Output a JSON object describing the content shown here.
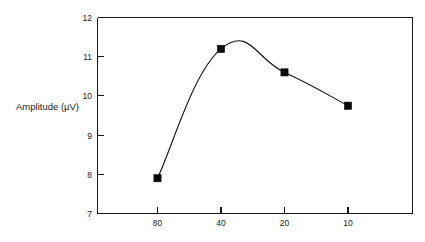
{
  "figure": {
    "background_color": "#ffffff",
    "width": 425,
    "height": 242
  },
  "chart_data": {
    "type": "line",
    "title": "",
    "subtitle": "",
    "xlabel": "",
    "ylabel": "Amplitude (µV)",
    "categories": [
      "80",
      "40",
      "20",
      "10"
    ],
    "values": [
      7.9,
      11.2,
      10.6,
      9.75
    ],
    "series": [
      {
        "name": "Amplitude",
        "values": [
          7.9,
          11.2,
          10.6,
          9.75
        ]
      }
    ],
    "x_tick_labels": [
      "80",
      "40",
      "20",
      "10"
    ],
    "y_tick_labels": [
      "7",
      "8",
      "9",
      "10",
      "11",
      "12"
    ],
    "y_tick_values": [
      7,
      8,
      9,
      10,
      11,
      12
    ],
    "ylim": [
      7,
      12
    ],
    "grid": false,
    "legend": false,
    "legend_position": "none",
    "marker": "square",
    "marker_color": "#0b0b0b",
    "line_color": "#111111",
    "smoothing": "spline",
    "annotations": []
  },
  "axes": {
    "y_label": "Amplitude (µV)",
    "y_ticks": [
      {
        "label": "12",
        "value": 12
      },
      {
        "label": "11",
        "value": 11
      },
      {
        "label": "10",
        "value": 10
      },
      {
        "label": "9",
        "value": 9
      },
      {
        "label": "8",
        "value": 8
      },
      {
        "label": "7",
        "value": 7
      }
    ],
    "x_ticks": [
      {
        "label": "80",
        "value": 80
      },
      {
        "label": "40",
        "value": 40
      },
      {
        "label": "20",
        "value": 20
      },
      {
        "label": "10",
        "value": 10
      }
    ]
  }
}
